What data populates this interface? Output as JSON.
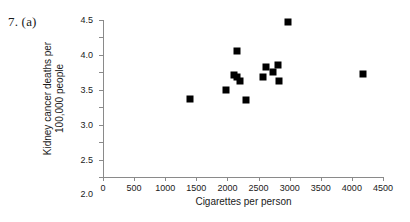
{
  "figure": {
    "problem_label": "7. (a)"
  },
  "chart_data": {
    "type": "scatter",
    "title": "",
    "xlabel": "Cigarettes per person",
    "ylabel": "Kidney cancer deaths per 100,000 people",
    "ylabel_line1": "Kidney cancer deaths per",
    "ylabel_line2": "100,000 people",
    "xlim": [
      0,
      4500
    ],
    "ylim": [
      0.0,
      4.5
    ],
    "xticks": [
      0,
      500,
      1000,
      1500,
      2000,
      2500,
      3000,
      3500,
      4000,
      4500
    ],
    "xtick_labels": [
      "0",
      "500",
      "1000",
      "1500",
      "2000",
      "2500",
      "3000",
      "3500",
      "4000",
      "4500"
    ],
    "yticks": [
      0.0,
      0.5,
      1.0,
      1.5,
      2.0,
      2.5,
      3.0,
      3.5,
      4.0,
      4.5
    ],
    "ytick_labels": [
      "0.0",
      "0.5",
      "1.0",
      "1.5",
      "2.0",
      "2.5",
      "3.0",
      "3.5",
      "4.0",
      "4.5"
    ],
    "grid": false,
    "legend": false,
    "marker": "square",
    "marker_color": "#000000",
    "axis_color": "#8a8a8a",
    "points": [
      {
        "x": 1400,
        "y": 2.25
      },
      {
        "x": 1975,
        "y": 2.5
      },
      {
        "x": 2100,
        "y": 2.93
      },
      {
        "x": 2150,
        "y": 2.88
      },
      {
        "x": 2150,
        "y": 3.6
      },
      {
        "x": 2200,
        "y": 2.74
      },
      {
        "x": 2300,
        "y": 2.2
      },
      {
        "x": 2570,
        "y": 2.88
      },
      {
        "x": 2620,
        "y": 3.14
      },
      {
        "x": 2740,
        "y": 3.02
      },
      {
        "x": 2820,
        "y": 3.22
      },
      {
        "x": 2830,
        "y": 2.75
      },
      {
        "x": 2980,
        "y": 4.45
      },
      {
        "x": 4180,
        "y": 2.95
      }
    ]
  }
}
